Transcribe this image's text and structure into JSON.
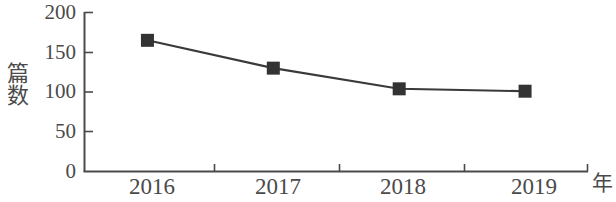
{
  "chart_data": {
    "type": "line",
    "title": "",
    "xlabel": "年",
    "ylabel": "篇数",
    "categories": [
      "2016",
      "2017",
      "2018",
      "2019"
    ],
    "values": [
      165,
      130,
      104,
      101
    ],
    "series": [
      {
        "name": "篇数",
        "values": [
          165,
          130,
          104,
          101
        ]
      }
    ],
    "ylim": [
      0,
      200
    ],
    "yticks": [
      0,
      50,
      100,
      150,
      200
    ],
    "ytick_labels": [
      "0",
      "50",
      "100",
      "150",
      "200"
    ],
    "xtick_labels": [
      "2016",
      "2017",
      "2018",
      "2019"
    ],
    "grid": false,
    "legend": null,
    "legend_position": "none",
    "marker": "square",
    "line_color": "#3a3a3a",
    "marker_color": "#333333",
    "axis_color": "#4a4a4a",
    "text_color": "#4a4a4a",
    "background_color": "#ffffff"
  },
  "axes": {
    "y_title": "篇数",
    "x_title": "年"
  }
}
